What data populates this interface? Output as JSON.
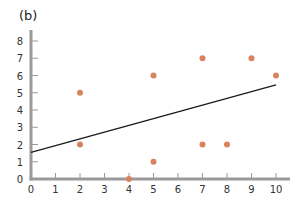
{
  "panel_label": "(b)",
  "chart_data": {
    "type": "scatter",
    "title": "",
    "xlabel": "",
    "ylabel": "",
    "xlim": [
      0,
      10
    ],
    "ylim": [
      0,
      8
    ],
    "xticks": [
      0,
      1,
      2,
      3,
      4,
      5,
      6,
      7,
      8,
      9,
      10
    ],
    "yticks": [
      0,
      1,
      2,
      3,
      4,
      5,
      6,
      7,
      8
    ],
    "grid": false,
    "legend": null,
    "point_color": "#d9825f",
    "line_color": "#1a1a1a",
    "axis_color": "#9a9a9a",
    "series": [
      {
        "name": "points",
        "x": [
          2,
          2,
          4,
          5,
          5,
          7,
          7,
          8,
          9,
          10
        ],
        "y": [
          5,
          2,
          0,
          6,
          1,
          7,
          2,
          2,
          7,
          6
        ]
      }
    ],
    "fit_line": {
      "x": [
        0,
        10
      ],
      "y": [
        1.55,
        5.45
      ]
    }
  }
}
